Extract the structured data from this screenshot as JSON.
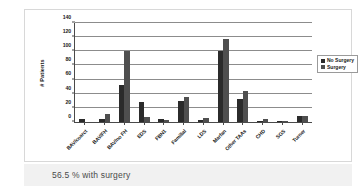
{
  "caption": {
    "text": "56.5 % with surgery"
  },
  "chart_data": {
    "type": "bar",
    "title": "",
    "subtitle": "",
    "xlabel": "",
    "ylabel": "# Patients",
    "ylim": [
      0,
      140
    ],
    "yticks": [
      0,
      20,
      40,
      60,
      80,
      100,
      120,
      140
    ],
    "grid": true,
    "legend_position": "right",
    "categories": [
      "BAV/coarct",
      "BAV/FH",
      "BAV/no FH",
      "EDS",
      "FBN1",
      "Familial",
      "LDS",
      "Marfan",
      "Other TAAs",
      "CHD",
      "SGS",
      "Turner"
    ],
    "series": [
      {
        "name": "No Surgery",
        "color": "#2b2b2b",
        "values": [
          4,
          4,
          53,
          28,
          4,
          30,
          3,
          101,
          32,
          1,
          1,
          8
        ]
      },
      {
        "name": "Surgery",
        "color": "#4f4f4f",
        "values": [
          0,
          12,
          100,
          7,
          3,
          35,
          5,
          118,
          44,
          4,
          1,
          8
        ]
      }
    ]
  }
}
